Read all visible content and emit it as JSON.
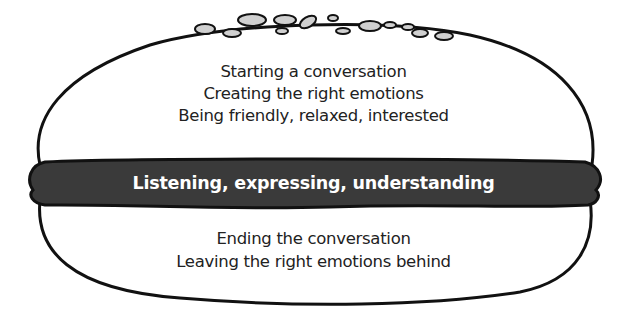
{
  "diagram": {
    "type": "hamburger-model",
    "top_bun": {
      "lines": [
        "Starting a conversation",
        "Creating the right emotions",
        "Being friendly, relaxed, interested"
      ]
    },
    "patty": {
      "label": "Listening, expressing, understanding",
      "color": "#3a3a3a"
    },
    "bottom_bun": {
      "lines": [
        "Ending the conversation",
        "Leaving the right emotions behind"
      ]
    },
    "outline_color": "#111111",
    "seed_color": "#cfcfcf"
  }
}
